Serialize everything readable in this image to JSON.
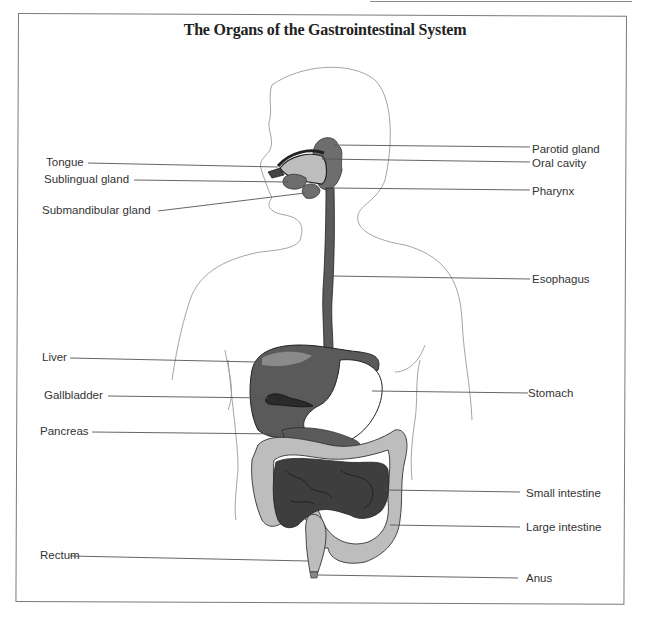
{
  "title": "The Organs of the Gastrointestinal System",
  "labels": {
    "left": [
      {
        "id": "tongue",
        "text": "Tongue"
      },
      {
        "id": "sublingual-gland",
        "text": "Sublingual gland"
      },
      {
        "id": "submandibular-gland",
        "text": "Submandibular gland"
      },
      {
        "id": "liver",
        "text": "Liver"
      },
      {
        "id": "gallbladder",
        "text": "Gallbladder"
      },
      {
        "id": "pancreas",
        "text": "Pancreas"
      },
      {
        "id": "rectum",
        "text": "Rectum"
      }
    ],
    "right": [
      {
        "id": "parotid-gland",
        "text": "Parotid gland"
      },
      {
        "id": "oral-cavity",
        "text": "Oral cavity"
      },
      {
        "id": "pharynx",
        "text": "Pharynx"
      },
      {
        "id": "esophagus",
        "text": "Esophagus"
      },
      {
        "id": "stomach",
        "text": "Stomach"
      },
      {
        "id": "small-intestine",
        "text": "Small intestine"
      },
      {
        "id": "large-intestine",
        "text": "Large intestine"
      },
      {
        "id": "anus",
        "text": "Anus"
      }
    ]
  },
  "colors": {
    "outline": "#9a9a9a",
    "organ_dark": "#4a4a4a",
    "organ_mid": "#6e6e6e",
    "organ_light": "#bdbdbd",
    "leader": "#555555",
    "text": "#333333"
  }
}
